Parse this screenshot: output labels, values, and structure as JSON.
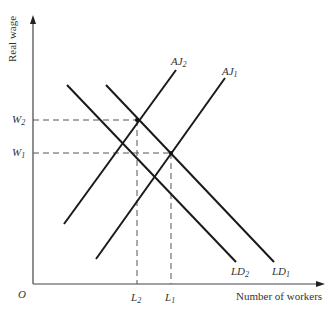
{
  "diagram": {
    "type": "labor-market-supply-demand",
    "axes": {
      "y_label": "Real wage",
      "x_label": "Number of workers",
      "origin_label": "O"
    },
    "wage_levels": [
      {
        "label": "W",
        "sub": "2",
        "y": 120
      },
      {
        "label": "W",
        "sub": "1",
        "y": 153
      }
    ],
    "employment_levels": [
      {
        "label": "L",
        "sub": "2",
        "x": 137
      },
      {
        "label": "L",
        "sub": "1",
        "x": 171
      }
    ],
    "curves": [
      {
        "name": "AJ",
        "sub": "2",
        "kind": "supply",
        "from": [
          64,
          224
        ],
        "to": [
          176,
          70
        ]
      },
      {
        "name": "AJ",
        "sub": "1",
        "kind": "supply",
        "from": [
          96,
          259
        ],
        "to": [
          225,
          78
        ]
      },
      {
        "name": "LD",
        "sub": "2",
        "kind": "demand",
        "from": [
          67,
          85
        ],
        "to": [
          236,
          262
        ]
      },
      {
        "name": "LD",
        "sub": "1",
        "kind": "demand",
        "from": [
          106,
          85
        ],
        "to": [
          274,
          262
        ]
      }
    ],
    "equilibria": [
      {
        "wage": "W2",
        "employment": "L2",
        "point": [
          137,
          120
        ]
      },
      {
        "wage": "W1",
        "employment": "L1",
        "point": [
          171,
          153
        ]
      }
    ]
  },
  "labels": {
    "y_axis": "Real wage",
    "x_axis": "Number of workers",
    "origin": "O",
    "w2_main": "W",
    "w2_sub": "2",
    "w1_main": "W",
    "w1_sub": "1",
    "l2_main": "L",
    "l2_sub": "2",
    "l1_main": "L",
    "l1_sub": "1",
    "aj2_main": "AJ",
    "aj2_sub": "2",
    "aj1_main": "AJ",
    "aj1_sub": "1",
    "ld2_main": "LD",
    "ld2_sub": "2",
    "ld1_main": "LD",
    "ld1_sub": "1"
  }
}
